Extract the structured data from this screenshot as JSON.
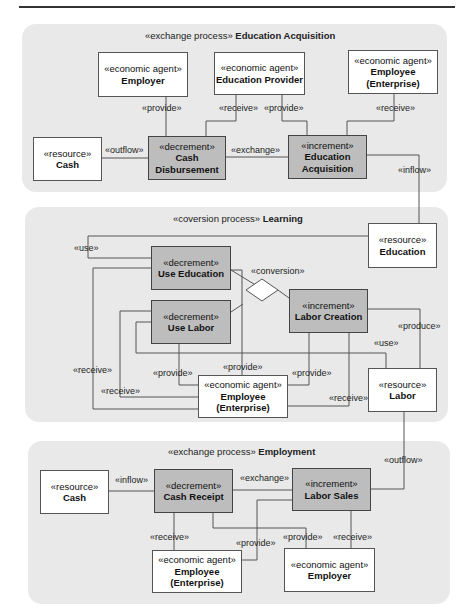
{
  "panels": [
    {
      "id": "education-acquisition",
      "stereotype": "«exchange process»",
      "name": "Education Acquisition"
    },
    {
      "id": "learning",
      "stereotype": "«coversion process»",
      "name": "Learning"
    },
    {
      "id": "employment",
      "stereotype": "«exchange process»",
      "name": "Employment"
    }
  ],
  "nodes": {
    "p1_employer": {
      "stereotype": "«economic agent»",
      "name": "Employer"
    },
    "p1_edu_provider": {
      "stereotype": "«economic agent»",
      "name": "Education Provider"
    },
    "p1_employee": {
      "stereotype": "«economic agent»",
      "name": "Employee",
      "name2": "(Enterprise)"
    },
    "p1_cash": {
      "stereotype": "«resource»",
      "name": "Cash"
    },
    "p1_cash_disb": {
      "stereotype": "«decrement»",
      "name": "Cash",
      "name2": "Disbursement"
    },
    "p1_edu_acq": {
      "stereotype": "«increment»",
      "name": "Education",
      "name2": "Acquisition"
    },
    "p2_education": {
      "stereotype": "«resource»",
      "name": "Education"
    },
    "p2_use_edu": {
      "stereotype": "«decrement»",
      "name": "Use Education"
    },
    "p2_use_labor": {
      "stereotype": "«decrement»",
      "name": "Use Labor"
    },
    "p2_labor_creation": {
      "stereotype": "«increment»",
      "name": "Labor Creation"
    },
    "p2_employee": {
      "stereotype": "«economic agent»",
      "name": "Employee",
      "name2": "(Enterprise)"
    },
    "p2_labor": {
      "stereotype": "«resource»",
      "name": "Labor"
    },
    "p3_cash": {
      "stereotype": "«resource»",
      "name": "Cash"
    },
    "p3_cash_receipt": {
      "stereotype": "«decrement»",
      "name": "Cash Receipt"
    },
    "p3_labor_sales": {
      "stereotype": "«increment»",
      "name": "Labor Sales"
    },
    "p3_employee": {
      "stereotype": "«economic agent»",
      "name": "Employee",
      "name2": "(Enterprise)"
    },
    "p3_employer": {
      "stereotype": "«economic agent»",
      "name": "Employer"
    }
  },
  "labels": {
    "p1_provide_employer": "«provide»",
    "p1_receive_provider": "«receive»",
    "p1_provide_provider": "«provide»",
    "p1_receive_employee": "«receive»",
    "p1_outflow": "«outflow»",
    "p1_exchange": "«exchange»",
    "p1_inflow": "«inflow»",
    "p2_use_education": "«use»",
    "p2_conversion": "«conversion»",
    "p2_produce": "«produce»",
    "p2_use_labor": "«use»",
    "p2_receive_outer": "«receive»",
    "p2_receive_inner": "«receive»",
    "p2_provide_uselabor": "«provide»",
    "p2_provide_useedu": "«provide»",
    "p2_provide_creation": "«provide»",
    "p2_receive_labor": "«receive»",
    "p3_outflow": "«outflow»",
    "p3_inflow": "«inflow»",
    "p3_exchange": "«exchange»",
    "p3_receive_employee": "«receive»",
    "p3_provide_employee": "«provide»",
    "p3_provide_employer": "«provide»",
    "p3_receive_employer": "«receive»"
  },
  "colors": {
    "panel_bg": "#e9e9e9",
    "event_fill": "#bdbdbd",
    "agent_fill": "#ffffff",
    "line": "#555555"
  }
}
